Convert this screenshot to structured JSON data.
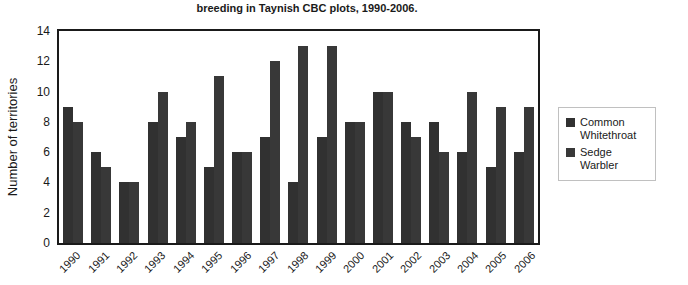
{
  "chart_data": {
    "type": "bar",
    "title": "breeding in Taynish CBC plots, 1990-2006.",
    "xlabel": "",
    "ylabel": "Number of territories",
    "ylim": [
      0,
      14
    ],
    "yticks": [
      0,
      2,
      4,
      6,
      8,
      10,
      12,
      14
    ],
    "grid": false,
    "legend_position": "right-middle",
    "categories": [
      "1990",
      "1991",
      "1992",
      "1993",
      "1994",
      "1995",
      "1996",
      "1997",
      "1998",
      "1999",
      "2000",
      "2001",
      "2002",
      "2003",
      "2004",
      "2005",
      "2006"
    ],
    "series": [
      {
        "name": "Common Whitethroat",
        "color": "#313131",
        "values": [
          9,
          6,
          4,
          8,
          7,
          5,
          6,
          7,
          4,
          7,
          8,
          10,
          8,
          8,
          6,
          5,
          6
        ]
      },
      {
        "name": "Sedge Warbler",
        "color": "#383838",
        "values": [
          8,
          5,
          4,
          10,
          8,
          11,
          6,
          12,
          13,
          13,
          8,
          10,
          7,
          6,
          10,
          9,
          9
        ]
      }
    ]
  },
  "colors": {
    "axis": "#1a1a1a",
    "text": "#1a1a1a",
    "legend_border": "#c0c0c0",
    "background": "#ffffff"
  }
}
